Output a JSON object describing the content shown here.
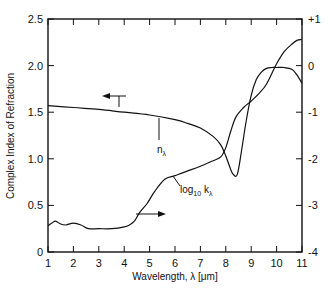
{
  "chart_data": {
    "type": "line",
    "title": "",
    "xlabel": "Wavelength, λ [μm]",
    "ylabel": "Complex Index of Refraction",
    "ylabel_right": "",
    "xlim": [
      1,
      11
    ],
    "ylim": [
      0,
      2.5
    ],
    "ylim_right": [
      -4,
      1
    ],
    "grid": false,
    "legend": "none (inline annotations with arrows)",
    "x_ticks": [
      "1",
      "2",
      "3",
      "4",
      "5",
      "6",
      "7",
      "8",
      "9",
      "10",
      "11"
    ],
    "y_ticks_left": [
      "0",
      "0.5",
      "1.0",
      "1.5",
      "2.0",
      "2.5"
    ],
    "y_ticks_right": [
      "-4",
      "-3",
      "-2",
      "-1",
      "0",
      "+1"
    ],
    "series": [
      {
        "name": "n_λ",
        "axis": "left",
        "x": [
          1,
          2,
          3,
          4,
          5,
          6,
          6.5,
          7,
          7.5,
          7.8,
          8.0,
          8.2,
          8.3,
          8.45,
          8.6,
          8.8,
          9.0,
          9.2,
          9.4,
          9.6,
          9.8,
          10.0,
          10.3,
          10.6,
          10.8,
          11.0
        ],
        "values": [
          1.57,
          1.55,
          1.53,
          1.5,
          1.47,
          1.42,
          1.38,
          1.33,
          1.24,
          1.15,
          1.03,
          0.88,
          0.83,
          0.83,
          1.05,
          1.4,
          1.68,
          1.85,
          1.93,
          1.97,
          1.98,
          1.98,
          1.98,
          1.96,
          1.9,
          1.81
        ]
      },
      {
        "name": "log10 k_λ",
        "axis": "right",
        "x": [
          1,
          1.15,
          1.3,
          1.5,
          1.7,
          2.0,
          2.3,
          2.6,
          3.0,
          3.5,
          4.0,
          4.2,
          4.4,
          4.6,
          4.9,
          5.2,
          5.6,
          6.0,
          6.5,
          7.0,
          7.5,
          7.8,
          8.0,
          8.2,
          8.4,
          8.7,
          9.0,
          9.3,
          9.6,
          10.0,
          10.3,
          10.6,
          10.8,
          11.0
        ],
        "values": [
          -3.44,
          -3.38,
          -3.34,
          -3.4,
          -3.42,
          -3.38,
          -3.42,
          -3.5,
          -3.5,
          -3.5,
          -3.46,
          -3.42,
          -3.34,
          -3.16,
          -2.96,
          -2.7,
          -2.44,
          -2.36,
          -2.26,
          -2.16,
          -2.04,
          -1.96,
          -1.76,
          -1.4,
          -1.1,
          -0.9,
          -0.76,
          -0.6,
          -0.4,
          0.04,
          0.3,
          0.46,
          0.54,
          0.56
        ]
      }
    ],
    "annotations": [
      {
        "text": "n_λ",
        "pointer_x": 5.1,
        "arrow_direction": "left (reads left axis)"
      },
      {
        "text": "log10 k_λ",
        "pointer_x": 5.7,
        "arrow_direction": "right (reads right axis)"
      }
    ]
  },
  "labels": {
    "xlabel": "Wavelength, λ [μm]",
    "ylabel": "Complex Index of Refraction",
    "n_label_main": "n",
    "n_label_sub": "λ",
    "k_label_main": "log",
    "k_label_base": "10",
    "k_label_var": " k",
    "k_label_sub": "λ"
  }
}
